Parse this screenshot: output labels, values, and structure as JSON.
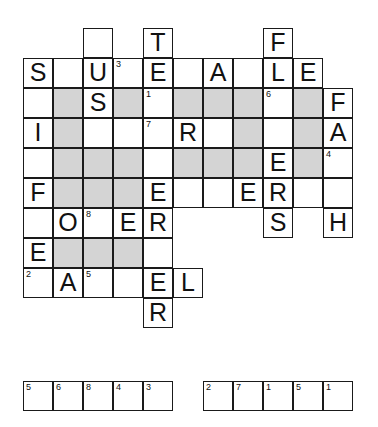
{
  "puzzle": {
    "title": "Crossword Puzzle Grid",
    "grid": {
      "columns": 11,
      "rows": 10,
      "cell_size_px": 30,
      "shaded_color": "#d4d4d4",
      "empty_color": "#ffffff",
      "border_color": "#1a1a1a"
    },
    "cells": [
      {
        "row": 0,
        "col": 2,
        "letter": "",
        "number": "",
        "shaded": false
      },
      {
        "row": 0,
        "col": 4,
        "letter": "T",
        "number": "",
        "shaded": false
      },
      {
        "row": 0,
        "col": 8,
        "letter": "F",
        "number": "",
        "shaded": false
      },
      {
        "row": 1,
        "col": 0,
        "letter": "S",
        "number": "",
        "shaded": false
      },
      {
        "row": 1,
        "col": 1,
        "letter": "",
        "number": "",
        "shaded": false
      },
      {
        "row": 1,
        "col": 2,
        "letter": "U",
        "number": "",
        "shaded": false
      },
      {
        "row": 1,
        "col": 3,
        "letter": "",
        "number": "3",
        "shaded": false
      },
      {
        "row": 1,
        "col": 4,
        "letter": "E",
        "number": "",
        "shaded": false
      },
      {
        "row": 1,
        "col": 5,
        "letter": "",
        "number": "",
        "shaded": false
      },
      {
        "row": 1,
        "col": 6,
        "letter": "A",
        "number": "",
        "shaded": false
      },
      {
        "row": 1,
        "col": 7,
        "letter": "",
        "number": "",
        "shaded": false
      },
      {
        "row": 1,
        "col": 8,
        "letter": "L",
        "number": "",
        "shaded": false
      },
      {
        "row": 1,
        "col": 9,
        "letter": "E",
        "number": "",
        "shaded": false
      },
      {
        "row": 2,
        "col": 0,
        "letter": "",
        "number": "",
        "shaded": false
      },
      {
        "row": 2,
        "col": 1,
        "letter": "",
        "number": "",
        "shaded": true
      },
      {
        "row": 2,
        "col": 2,
        "letter": "S",
        "number": "",
        "shaded": false
      },
      {
        "row": 2,
        "col": 3,
        "letter": "",
        "number": "",
        "shaded": true
      },
      {
        "row": 2,
        "col": 4,
        "letter": "",
        "number": "1",
        "shaded": false
      },
      {
        "row": 2,
        "col": 5,
        "letter": "",
        "number": "",
        "shaded": true
      },
      {
        "row": 2,
        "col": 6,
        "letter": "",
        "number": "",
        "shaded": true
      },
      {
        "row": 2,
        "col": 7,
        "letter": "",
        "number": "",
        "shaded": true
      },
      {
        "row": 2,
        "col": 8,
        "letter": "",
        "number": "6",
        "shaded": false
      },
      {
        "row": 2,
        "col": 9,
        "letter": "",
        "number": "",
        "shaded": true
      },
      {
        "row": 2,
        "col": 10,
        "letter": "F",
        "number": "",
        "shaded": false
      },
      {
        "row": 3,
        "col": 0,
        "letter": "I",
        "number": "",
        "shaded": false
      },
      {
        "row": 3,
        "col": 1,
        "letter": "",
        "number": "",
        "shaded": true
      },
      {
        "row": 3,
        "col": 2,
        "letter": "",
        "number": "",
        "shaded": false
      },
      {
        "row": 3,
        "col": 3,
        "letter": "",
        "number": "",
        "shaded": false
      },
      {
        "row": 3,
        "col": 4,
        "letter": "",
        "number": "7",
        "shaded": false
      },
      {
        "row": 3,
        "col": 5,
        "letter": "R",
        "number": "",
        "shaded": false
      },
      {
        "row": 3,
        "col": 6,
        "letter": "",
        "number": "",
        "shaded": false
      },
      {
        "row": 3,
        "col": 7,
        "letter": "",
        "number": "",
        "shaded": true
      },
      {
        "row": 3,
        "col": 8,
        "letter": "",
        "number": "",
        "shaded": false
      },
      {
        "row": 3,
        "col": 9,
        "letter": "",
        "number": "",
        "shaded": true
      },
      {
        "row": 3,
        "col": 10,
        "letter": "A",
        "number": "",
        "shaded": false
      },
      {
        "row": 4,
        "col": 0,
        "letter": "",
        "number": "",
        "shaded": false
      },
      {
        "row": 4,
        "col": 1,
        "letter": "",
        "number": "",
        "shaded": true
      },
      {
        "row": 4,
        "col": 2,
        "letter": "",
        "number": "",
        "shaded": true
      },
      {
        "row": 4,
        "col": 3,
        "letter": "",
        "number": "",
        "shaded": true
      },
      {
        "row": 4,
        "col": 4,
        "letter": "",
        "number": "",
        "shaded": false
      },
      {
        "row": 4,
        "col": 5,
        "letter": "",
        "number": "",
        "shaded": true
      },
      {
        "row": 4,
        "col": 6,
        "letter": "",
        "number": "",
        "shaded": true
      },
      {
        "row": 4,
        "col": 7,
        "letter": "",
        "number": "",
        "shaded": true
      },
      {
        "row": 4,
        "col": 8,
        "letter": "E",
        "number": "",
        "shaded": false
      },
      {
        "row": 4,
        "col": 9,
        "letter": "",
        "number": "",
        "shaded": true
      },
      {
        "row": 4,
        "col": 10,
        "letter": "",
        "number": "4",
        "shaded": false
      },
      {
        "row": 5,
        "col": 0,
        "letter": "F",
        "number": "",
        "shaded": false
      },
      {
        "row": 5,
        "col": 1,
        "letter": "",
        "number": "",
        "shaded": true
      },
      {
        "row": 5,
        "col": 2,
        "letter": "",
        "number": "",
        "shaded": true
      },
      {
        "row": 5,
        "col": 3,
        "letter": "",
        "number": "",
        "shaded": true
      },
      {
        "row": 5,
        "col": 4,
        "letter": "E",
        "number": "",
        "shaded": false
      },
      {
        "row": 5,
        "col": 5,
        "letter": "",
        "number": "",
        "shaded": false
      },
      {
        "row": 5,
        "col": 6,
        "letter": "",
        "number": "",
        "shaded": false
      },
      {
        "row": 5,
        "col": 7,
        "letter": "E",
        "number": "",
        "shaded": false
      },
      {
        "row": 5,
        "col": 8,
        "letter": "R",
        "number": "",
        "shaded": false
      },
      {
        "row": 5,
        "col": 9,
        "letter": "",
        "number": "",
        "shaded": false
      },
      {
        "row": 5,
        "col": 10,
        "letter": "",
        "number": "",
        "shaded": false
      },
      {
        "row": 6,
        "col": 0,
        "letter": "",
        "number": "",
        "shaded": false
      },
      {
        "row": 6,
        "col": 1,
        "letter": "O",
        "number": "",
        "shaded": false
      },
      {
        "row": 6,
        "col": 2,
        "letter": "",
        "number": "8",
        "shaded": false
      },
      {
        "row": 6,
        "col": 3,
        "letter": "E",
        "number": "",
        "shaded": false
      },
      {
        "row": 6,
        "col": 4,
        "letter": "R",
        "number": "",
        "shaded": false
      },
      {
        "row": 6,
        "col": 8,
        "letter": "S",
        "number": "",
        "shaded": false
      },
      {
        "row": 6,
        "col": 10,
        "letter": "H",
        "number": "",
        "shaded": false
      },
      {
        "row": 7,
        "col": 0,
        "letter": "E",
        "number": "",
        "shaded": false
      },
      {
        "row": 7,
        "col": 1,
        "letter": "",
        "number": "",
        "shaded": true
      },
      {
        "row": 7,
        "col": 2,
        "letter": "",
        "number": "",
        "shaded": true
      },
      {
        "row": 7,
        "col": 3,
        "letter": "",
        "number": "",
        "shaded": true
      },
      {
        "row": 7,
        "col": 4,
        "letter": "",
        "number": "",
        "shaded": false
      },
      {
        "row": 8,
        "col": 0,
        "letter": "",
        "number": "2",
        "shaded": false
      },
      {
        "row": 8,
        "col": 1,
        "letter": "A",
        "number": "",
        "shaded": false
      },
      {
        "row": 8,
        "col": 2,
        "letter": "",
        "number": "5",
        "shaded": false
      },
      {
        "row": 8,
        "col": 3,
        "letter": "",
        "number": "",
        "shaded": false
      },
      {
        "row": 8,
        "col": 4,
        "letter": "E",
        "number": "",
        "shaded": false
      },
      {
        "row": 8,
        "col": 5,
        "letter": "L",
        "number": "",
        "shaded": false
      },
      {
        "row": 9,
        "col": 4,
        "letter": "R",
        "number": "",
        "shaded": false
      }
    ],
    "answer_strips": [
      {
        "name": "left",
        "cells": [
          {
            "number": "5",
            "letter": ""
          },
          {
            "number": "6",
            "letter": ""
          },
          {
            "number": "8",
            "letter": ""
          },
          {
            "number": "4",
            "letter": ""
          },
          {
            "number": "3",
            "letter": ""
          }
        ]
      },
      {
        "name": "right",
        "cells": [
          {
            "number": "2",
            "letter": ""
          },
          {
            "number": "7",
            "letter": ""
          },
          {
            "number": "1",
            "letter": ""
          },
          {
            "number": "5",
            "letter": ""
          },
          {
            "number": "1",
            "letter": ""
          }
        ]
      }
    ]
  }
}
